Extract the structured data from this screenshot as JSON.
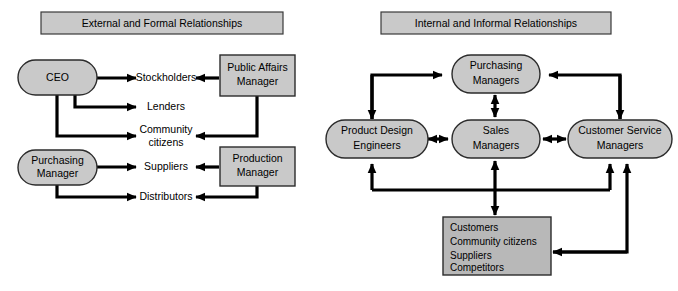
{
  "figure": {
    "panels": [
      {
        "id": "external",
        "title": "External and Formal Relationships",
        "nodes": {
          "ceo": "CEO",
          "purchasing_manager": "Purchasing\nManager",
          "public_affairs_manager": "Public Affairs\nManager",
          "production_manager": "Production\nManager"
        },
        "targets": {
          "stockholders": "Stockholders",
          "lenders": "Lenders",
          "community_citizens_line1": "Community",
          "community_citizens_line2": "citizens",
          "suppliers": "Suppliers",
          "distributors": "Distributors"
        }
      },
      {
        "id": "internal",
        "title": "Internal and Informal Relationships",
        "nodes": {
          "purchasing_managers_l1": "Purchasing",
          "purchasing_managers_l2": "Managers",
          "product_design_l1": "Product Design",
          "product_design_l2": "Engineers",
          "sales_managers_l1": "Sales",
          "sales_managers_l2": "Managers",
          "customer_service_l1": "Customer Service",
          "customer_service_l2": "Managers"
        },
        "stakeholder_box": {
          "items": [
            "Customers",
            "Community citizens",
            "Suppliers",
            "Competitors"
          ]
        }
      }
    ],
    "colors": {
      "fill_gray": "#c9c9c9",
      "fill_gray_dark": "#b8b8b8",
      "stroke": "#2b2b2b",
      "background": "#ffffff",
      "connector": "#000000"
    }
  }
}
